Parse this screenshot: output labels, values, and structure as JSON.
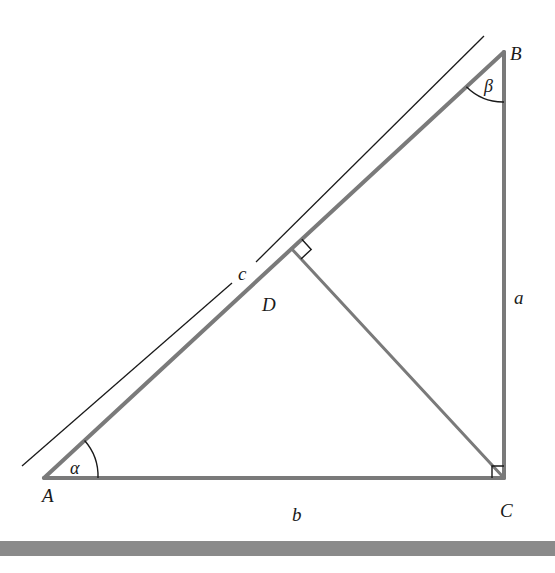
{
  "diagram": {
    "vertices": {
      "A": {
        "label": "A",
        "x": 44,
        "y": 478
      },
      "B": {
        "label": "B",
        "x": 504,
        "y": 52
      },
      "C": {
        "label": "C",
        "x": 504,
        "y": 478
      },
      "D": {
        "label": "D",
        "x": 291.6,
        "y": 248.7
      }
    },
    "sides": {
      "a": {
        "label": "a",
        "from": "B",
        "to": "C"
      },
      "b": {
        "label": "b",
        "from": "A",
        "to": "C"
      },
      "c": {
        "label": "c",
        "from": "A",
        "to": "B"
      }
    },
    "angles": {
      "alpha": {
        "label": "α",
        "at": "A"
      },
      "beta": {
        "label": "β",
        "at": "B"
      }
    },
    "right_angles": [
      "C",
      "D"
    ],
    "colors": {
      "triangle_stroke": "#7a7a7a",
      "thin_stroke": "#1a1a1a",
      "bar": "#8a8a8a",
      "background": "#ffffff"
    }
  }
}
